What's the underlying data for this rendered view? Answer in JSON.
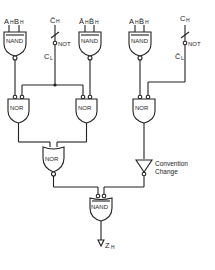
{
  "diagram": {
    "type": "logic-circuit",
    "gates": {
      "nand_left": {
        "label": "NAND",
        "inputs": [
          "A_H",
          "B_H"
        ]
      },
      "not_left": {
        "label": "NOT",
        "input": "C̄_H",
        "output": "C_L"
      },
      "nand_mid": {
        "label": "NAND",
        "inputs": [
          "Ā_H",
          "B̄_H"
        ]
      },
      "nand_right": {
        "label": "NAND",
        "inputs": [
          "A_H",
          "B̄_H"
        ]
      },
      "not_right": {
        "label": "NOT",
        "input": "C_H",
        "output": "C̄_L"
      },
      "nor_left": {
        "label": "NOR"
      },
      "nor_mid": {
        "label": "NOR"
      },
      "nor_right": {
        "label": "NOR"
      },
      "nor_bottom": {
        "label": "NOR"
      },
      "buffer": {
        "label_line1": "Convention",
        "label_line2": "Change"
      },
      "nand_final": {
        "label": "NAND",
        "output": "Z_H"
      }
    },
    "labels": {
      "a": "A",
      "b": "B",
      "h": "H",
      "l": "L",
      "c": "C",
      "z": "Z",
      "abar": "Ā",
      "bbar": "B̄",
      "cbar": "C̄",
      "nand": "NAND",
      "nor": "NOR",
      "not": "NOT",
      "conv1": "Convention",
      "conv2": "Change"
    }
  }
}
